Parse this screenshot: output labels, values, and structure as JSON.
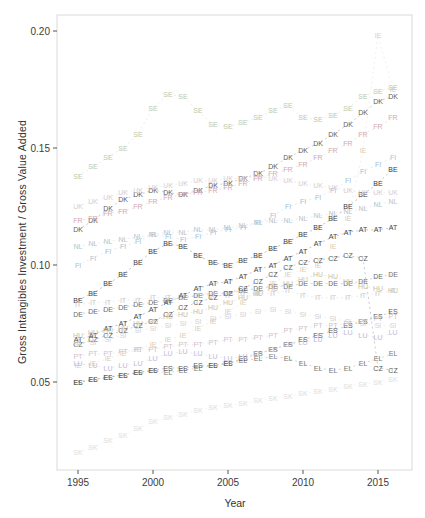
{
  "figure": {
    "kind": "scatter-text-plot",
    "background": "#ffffff",
    "panel": {
      "left": 57,
      "top": 15,
      "right": 412,
      "bottom": 470,
      "border_color": "#d9d9d9",
      "fill": "#ffffff"
    },
    "tick_color": "#555555",
    "tick_label_color": "#3c3c3c"
  },
  "chart_data": {
    "type": "scatter",
    "title": "",
    "xlabel": "Year",
    "ylabel": "Gross Intangibles Investment / Gross Value Added",
    "x_ticks": [
      1995,
      2000,
      2005,
      2010,
      2015
    ],
    "y_ticks": [
      0.05,
      0.1,
      0.15,
      0.2
    ],
    "y_tick_labels": [
      "0.05",
      "0.10",
      "0.15",
      "0.20"
    ],
    "xlim": [
      1993.6,
      2017.3
    ],
    "ylim": [
      0.012,
      0.207
    ],
    "grid": false,
    "legend_position": "none",
    "marker": "country-code text label",
    "line_style": "dashed connector between consecutive years",
    "years": [
      1995,
      1996,
      1997,
      1998,
      1999,
      2000,
      2001,
      2002,
      2003,
      2004,
      2005,
      2006,
      2007,
      2008,
      2009,
      2010,
      2011,
      2012,
      2013,
      2014,
      2015,
      2016
    ],
    "series": [
      {
        "name": "AT",
        "color": "#474747",
        "values": [
          0.068,
          0.07,
          0.073,
          0.075,
          0.078,
          0.081,
          0.084,
          0.087,
          0.09,
          0.092,
          0.093,
          0.095,
          0.098,
          0.1,
          0.103,
          0.106,
          0.109,
          0.112,
          0.114,
          0.115,
          0.115,
          0.116
        ]
      },
      {
        "name": "BE",
        "color": "#3c3c3c",
        "values": [
          0.085,
          0.088,
          0.092,
          0.096,
          0.101,
          0.106,
          0.109,
          0.108,
          0.104,
          0.101,
          0.1,
          0.102,
          0.104,
          0.107,
          0.11,
          0.113,
          0.116,
          0.12,
          0.125,
          0.13,
          0.135,
          0.141
        ]
      },
      {
        "name": "CZ",
        "color": "#565656",
        "values": [
          0.066,
          0.068,
          0.07,
          0.072,
          0.074,
          0.076,
          0.079,
          0.082,
          0.084,
          0.086,
          0.088,
          0.09,
          0.093,
          0.096,
          0.099,
          0.101,
          0.102,
          0.103,
          0.104,
          0.103,
          0.056,
          0.055
        ]
      },
      {
        "name": "DE",
        "color": "#6f6f6f",
        "values": [
          0.079,
          0.08,
          0.081,
          0.082,
          0.083,
          0.084,
          0.085,
          0.086,
          0.087,
          0.088,
          0.088,
          0.089,
          0.09,
          0.091,
          0.091,
          0.092,
          0.092,
          0.092,
          0.092,
          0.093,
          0.095,
          0.096
        ]
      },
      {
        "name": "DK",
        "color": "#636363",
        "values": [
          0.115,
          0.119,
          0.124,
          0.128,
          0.13,
          0.132,
          0.131,
          0.13,
          0.132,
          0.134,
          0.135,
          0.137,
          0.139,
          0.142,
          0.146,
          0.149,
          0.152,
          0.156,
          0.16,
          0.165,
          0.17,
          0.172
        ]
      },
      {
        "name": "EL",
        "color": "#7b7b7b",
        "values": [
          0.05,
          0.051,
          0.052,
          0.053,
          0.054,
          0.055,
          0.054,
          0.055,
          0.056,
          0.057,
          0.058,
          0.059,
          0.06,
          0.061,
          0.06,
          0.058,
          0.056,
          0.055,
          0.056,
          0.058,
          0.06,
          0.062
        ]
      },
      {
        "name": "ES",
        "color": "#585858",
        "values": [
          0.05,
          0.051,
          0.052,
          0.053,
          0.054,
          0.055,
          0.056,
          0.056,
          0.057,
          0.057,
          0.058,
          0.06,
          0.062,
          0.064,
          0.066,
          0.068,
          0.07,
          0.072,
          0.074,
          0.076,
          0.078,
          0.08
        ]
      },
      {
        "name": "FI",
        "color": "#aabfd4",
        "values": [
          0.1,
          0.103,
          0.106,
          0.108,
          0.11,
          0.113,
          0.112,
          0.111,
          0.112,
          0.114,
          0.115,
          0.116,
          0.118,
          0.121,
          0.125,
          0.127,
          0.129,
          0.132,
          0.136,
          0.14,
          0.143,
          0.146
        ]
      },
      {
        "name": "FR",
        "color": "#d2a9b4",
        "values": [
          0.119,
          0.12,
          0.122,
          0.123,
          0.125,
          0.127,
          0.129,
          0.13,
          0.131,
          0.132,
          0.133,
          0.135,
          0.137,
          0.139,
          0.141,
          0.143,
          0.146,
          0.149,
          0.152,
          0.156,
          0.159,
          0.163
        ]
      },
      {
        "name": "HU",
        "color": "#ccbfa6",
        "values": [
          0.07,
          0.071,
          0.072,
          0.073,
          0.075,
          0.076,
          0.078,
          0.079,
          0.08,
          0.082,
          0.084,
          0.086,
          0.088,
          0.09,
          0.092,
          0.094,
          0.096,
          0.095,
          0.093,
          0.091,
          0.09,
          0.089
        ]
      },
      {
        "name": "IE",
        "color": "#d9cdb6",
        "values": [
          0.057,
          0.058,
          0.06,
          0.062,
          0.064,
          0.066,
          0.068,
          0.07,
          0.073,
          0.076,
          0.08,
          0.084,
          0.088,
          0.092,
          0.096,
          0.098,
          0.1,
          0.108,
          0.12,
          0.149,
          0.198,
          0.175
        ]
      },
      {
        "name": "IT",
        "color": "#c7c7c7",
        "values": [
          0.083,
          0.084,
          0.084,
          0.085,
          0.085,
          0.086,
          0.086,
          0.086,
          0.087,
          0.087,
          0.087,
          0.088,
          0.088,
          0.088,
          0.089,
          0.087,
          0.086,
          0.086,
          0.086,
          0.087,
          0.088,
          0.089
        ]
      },
      {
        "name": "LU",
        "color": "#c2bbd8",
        "values": [
          0.058,
          0.057,
          0.056,
          0.057,
          0.058,
          0.06,
          0.062,
          0.063,
          0.062,
          0.061,
          0.06,
          0.061,
          0.062,
          0.064,
          0.066,
          0.067,
          0.068,
          0.07,
          0.071,
          0.07,
          0.069,
          0.071
        ]
      },
      {
        "name": "NL",
        "color": "#b6c3cc",
        "values": [
          0.108,
          0.109,
          0.11,
          0.111,
          0.112,
          0.113,
          0.114,
          0.114,
          0.115,
          0.115,
          0.116,
          0.117,
          0.118,
          0.119,
          0.119,
          0.12,
          0.121,
          0.122,
          0.123,
          0.124,
          0.126,
          0.127
        ]
      },
      {
        "name": "PT",
        "color": "#cfc1c9",
        "values": [
          0.061,
          0.062,
          0.062,
          0.063,
          0.064,
          0.064,
          0.065,
          0.066,
          0.066,
          0.067,
          0.068,
          0.068,
          0.069,
          0.07,
          0.072,
          0.073,
          0.074,
          0.074,
          0.075,
          0.076,
          0.077,
          0.078
        ]
      },
      {
        "name": "SE",
        "color": "#bccaae",
        "values": [
          0.138,
          0.142,
          0.146,
          0.15,
          0.156,
          0.167,
          0.173,
          0.172,
          0.166,
          0.16,
          0.159,
          0.161,
          0.163,
          0.166,
          0.168,
          0.163,
          0.162,
          0.164,
          0.167,
          0.172,
          0.174,
          0.176
        ]
      },
      {
        "name": "SI",
        "color": "#d2d2d2",
        "values": [
          0.066,
          0.067,
          0.068,
          0.07,
          0.072,
          0.073,
          0.074,
          0.075,
          0.076,
          0.077,
          0.078,
          0.079,
          0.08,
          0.081,
          0.08,
          0.079,
          0.078,
          0.077,
          0.076,
          0.075,
          0.074,
          0.074
        ]
      },
      {
        "name": "SK",
        "color": "#dedede",
        "values": [
          0.02,
          0.022,
          0.025,
          0.027,
          0.03,
          0.033,
          0.035,
          0.036,
          0.038,
          0.039,
          0.04,
          0.041,
          0.042,
          0.043,
          0.044,
          0.045,
          0.046,
          0.047,
          0.048,
          0.049,
          0.05,
          0.051
        ]
      },
      {
        "name": "UK",
        "color": "#d9cbd1",
        "values": [
          0.125,
          0.127,
          0.129,
          0.131,
          0.132,
          0.133,
          0.134,
          0.135,
          0.136,
          0.136,
          0.137,
          0.137,
          0.138,
          0.137,
          0.136,
          0.135,
          0.134,
          0.133,
          0.132,
          0.131,
          0.131,
          0.131
        ]
      }
    ]
  }
}
